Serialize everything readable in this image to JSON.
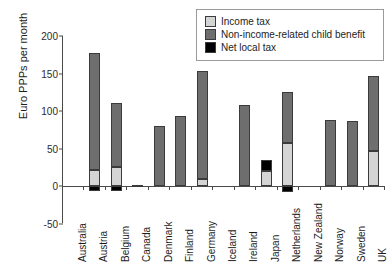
{
  "chart_data": {
    "type": "bar",
    "stacked": true,
    "title": "",
    "xlabel": "",
    "ylabel": "Euro PPPs per month",
    "ylim": [
      -50,
      200
    ],
    "yticks": [
      200,
      150,
      100,
      50,
      0,
      -50
    ],
    "grid": false,
    "legend_position": "top-right",
    "categories": [
      "Australia",
      "Austria",
      "Belgium",
      "Canada",
      "Denmark",
      "Finland",
      "Germany",
      "Iceland",
      "Ireland",
      "Japan",
      "Netherlands",
      "New Zealand",
      "Norway",
      "Sweden",
      "UK"
    ],
    "series": [
      {
        "name": "Income tax",
        "color": "#d4d4d4",
        "values": [
          0,
          21,
          25,
          0,
          0,
          0,
          9,
          0,
          0,
          20,
          57,
          0,
          0,
          0,
          47
        ]
      },
      {
        "name": "Non-income-related child benefit",
        "color": "#6e6e6e",
        "values": [
          0,
          157,
          86,
          2,
          80,
          93,
          144,
          0,
          108,
          0,
          68,
          0,
          88,
          87,
          100
        ]
      },
      {
        "name": "Net local tax",
        "color": "#000000",
        "values": [
          0,
          -6,
          -6,
          0,
          0,
          0,
          0,
          0,
          0,
          15,
          -8,
          0,
          0,
          0,
          0
        ]
      }
    ],
    "totals": [
      0,
      178,
      111,
      2,
      80,
      93,
      153,
      0,
      108,
      35,
      125,
      0,
      88,
      87,
      147
    ]
  },
  "legend": {
    "items": [
      {
        "label": "Income tax",
        "color": "#d4d4d4"
      },
      {
        "label": "Non-income-related child benefit",
        "color": "#6e6e6e"
      },
      {
        "label": "Net local tax",
        "color": "#000000"
      }
    ]
  },
  "axes": {
    "y_axis_label": "Euro PPPs per month",
    "y_tick_labels": [
      "200",
      "150",
      "100",
      "50",
      "0",
      "-50"
    ]
  }
}
